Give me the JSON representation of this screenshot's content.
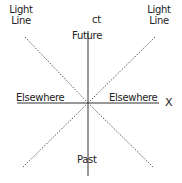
{
  "diagram": {
    "labels": {
      "light_line_left": [
        "Light",
        "Line"
      ],
      "light_line_right": [
        "Light",
        "Line"
      ],
      "time_axis": "ct",
      "future": "Future",
      "past": "Past",
      "elsewhere_left": "Elsewhere",
      "elsewhere_right": "Elsewhere",
      "space_axis": "X"
    },
    "colors": {
      "axis": "#333333",
      "light_line": "#555555",
      "text": "#222222",
      "background": "#ffffff"
    }
  }
}
